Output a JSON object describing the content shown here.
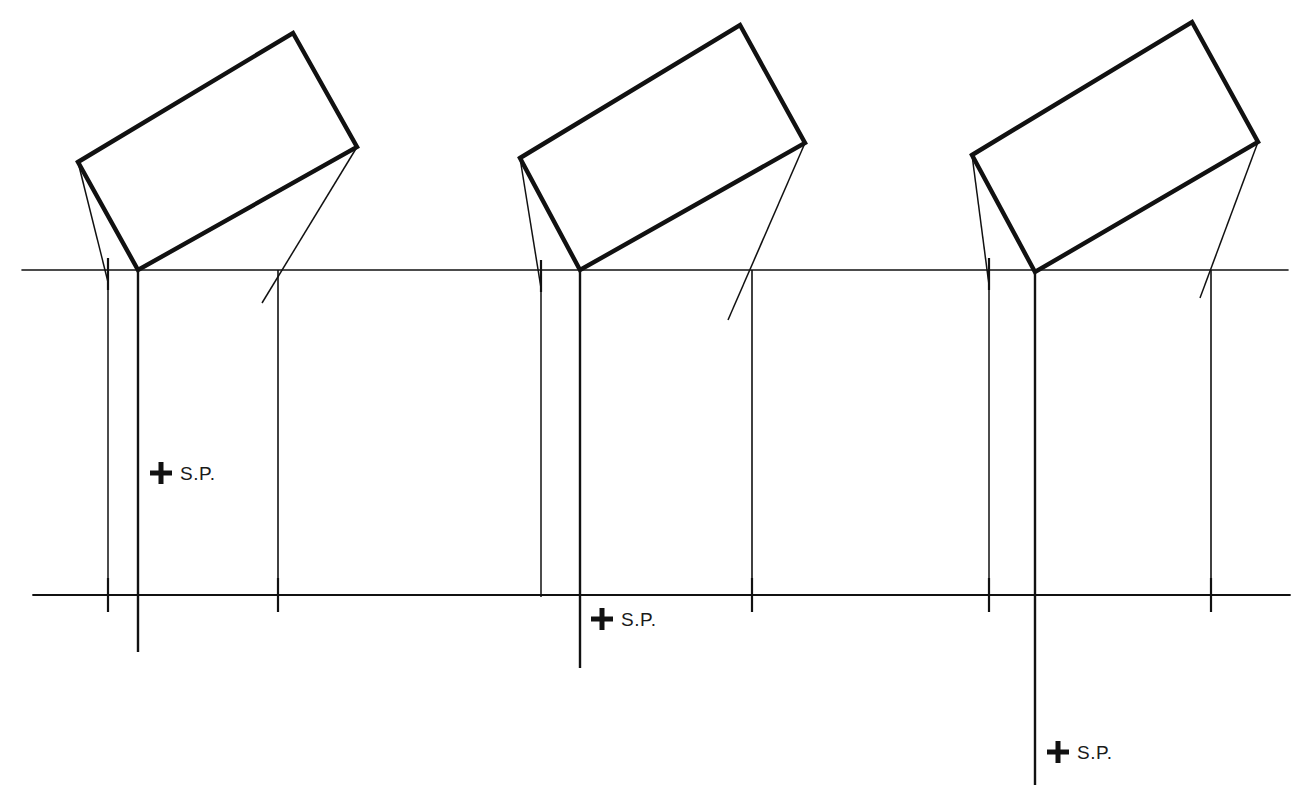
{
  "drawing": {
    "title": "Perspective construction — three plan-view rectangles over a picture line",
    "background_color": "#ffffff",
    "ink_color": "#111111",
    "canvas": {
      "width": 1310,
      "height": 807
    }
  },
  "lines": {
    "ground_line": {
      "name": "picture-plane-line",
      "x1": 22,
      "y1": 270,
      "x2": 1288,
      "y2": 270,
      "stroke_width": 1.6
    },
    "lower_line": {
      "name": "horizon-base-line",
      "x1": 33,
      "y1": 595,
      "x2": 1290,
      "y2": 595,
      "stroke_width": 1.8
    }
  },
  "groups": [
    {
      "id": "group-1",
      "rect": {
        "name": "rotated-rectangle-1",
        "points": "78,162 293,33 357,147 138,270",
        "stroke_width": 4.4
      },
      "left_projection": {
        "x1": 78,
        "y1": 162,
        "x2": 108,
        "y2": 282
      },
      "right_projection": {
        "x1": 357,
        "y1": 147,
        "x2": 262,
        "y2": 303
      },
      "verticals": [
        {
          "name": "left-drop-line",
          "x": 108,
          "y1": 270,
          "y2": 610,
          "stroke_width": 1.5
        },
        {
          "name": "center-drop-line",
          "x": 138,
          "y1": 270,
          "y2": 652,
          "stroke_width": 2.4
        },
        {
          "name": "right-drop-line",
          "x": 278,
          "y1": 270,
          "y2": 597,
          "stroke_width": 1.6
        }
      ],
      "station_point": {
        "name": "station-point-1",
        "label": "S.P.",
        "mark_x": 161,
        "mark_y": 473,
        "label_x": 180,
        "label_y": 480
      }
    },
    {
      "id": "group-2",
      "rect": {
        "name": "rotated-rectangle-2",
        "points": "520,158 740,25 805,143 580,270",
        "stroke_width": 4.4
      },
      "left_projection": {
        "x1": 520,
        "y1": 158,
        "x2": 541,
        "y2": 288
      },
      "right_projection": {
        "x1": 805,
        "y1": 143,
        "x2": 728,
        "y2": 320
      },
      "verticals": [
        {
          "name": "left-drop-line",
          "x": 541,
          "y1": 270,
          "y2": 597,
          "stroke_width": 1.5
        },
        {
          "name": "center-drop-line",
          "x": 580,
          "y1": 270,
          "y2": 668,
          "stroke_width": 2.4
        },
        {
          "name": "right-drop-line",
          "x": 752,
          "y1": 270,
          "y2": 597,
          "stroke_width": 1.6
        }
      ],
      "station_point": {
        "name": "station-point-2",
        "label": "S.P.",
        "mark_x": 602,
        "mark_y": 619,
        "label_x": 621,
        "label_y": 626
      }
    },
    {
      "id": "group-3",
      "rect": {
        "name": "rotated-rectangle-3",
        "points": "972,155 1192,22 1258,142 1035,272",
        "stroke_width": 4.4
      },
      "left_projection": {
        "x1": 972,
        "y1": 155,
        "x2": 989,
        "y2": 285
      },
      "right_projection": {
        "x1": 1258,
        "y1": 142,
        "x2": 1200,
        "y2": 298
      },
      "verticals": [
        {
          "name": "left-drop-line",
          "x": 989,
          "y1": 270,
          "y2": 597,
          "stroke_width": 1.5
        },
        {
          "name": "center-drop-line",
          "x": 1035,
          "y1": 270,
          "y2": 785,
          "stroke_width": 2.4
        },
        {
          "name": "right-drop-line",
          "x": 1211,
          "y1": 270,
          "y2": 597,
          "stroke_width": 1.6
        }
      ],
      "station_point": {
        "name": "station-point-3",
        "label": "S.P.",
        "mark_x": 1058,
        "mark_y": 752,
        "label_x": 1077,
        "label_y": 759
      }
    }
  ],
  "tick_marks": [
    {
      "name": "tick-ground-g1-left",
      "x": 108,
      "y1": 258,
      "y2": 290
    },
    {
      "name": "tick-ground-g2-left",
      "x": 541,
      "y1": 260,
      "y2": 292
    },
    {
      "name": "tick-ground-g3-left",
      "x": 989,
      "y1": 258,
      "y2": 290
    },
    {
      "name": "tick-lower-g1-left",
      "x": 108,
      "y1": 578,
      "y2": 612
    },
    {
      "name": "tick-lower-g1-right",
      "x": 278,
      "y1": 578,
      "y2": 612
    },
    {
      "name": "tick-lower-g2-right",
      "x": 752,
      "y1": 578,
      "y2": 612
    },
    {
      "name": "tick-lower-g3-left",
      "x": 989,
      "y1": 578,
      "y2": 612
    },
    {
      "name": "tick-lower-g3-right",
      "x": 1211,
      "y1": 578,
      "y2": 612
    }
  ]
}
